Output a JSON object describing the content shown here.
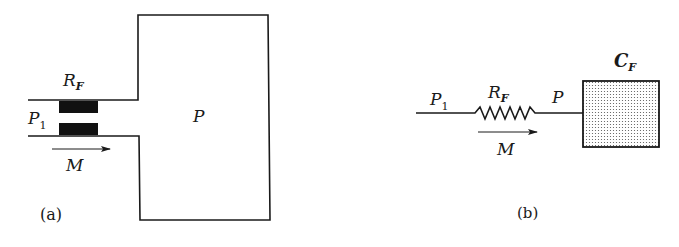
{
  "figure": {
    "panel_a": {
      "caption": "(a)",
      "labels": {
        "resistance": "R",
        "resistance_sub": "F",
        "inlet_pressure": "P",
        "inlet_pressure_sub": "1",
        "chamber_pressure": "P",
        "mass_flow": "M"
      },
      "description": "Physical system: inlet channel with flow restriction R_F feeding a large chamber at pressure P"
    },
    "panel_b": {
      "caption": "(b)",
      "labels": {
        "inlet_pressure": "P",
        "inlet_pressure_sub": "1",
        "resistance": "R",
        "resistance_sub": "F",
        "node_pressure": "P",
        "capacitance": "C",
        "capacitance_sub": "F",
        "mass_flow": "M"
      },
      "description": "Equivalent lumped circuit: resistor R_F in series with fluid capacitance C_F"
    },
    "colors": {
      "ink": "#1a1a1a",
      "background": "#ffffff",
      "restriction_fill": "#111111",
      "capacitor_dots": "#555555"
    }
  }
}
